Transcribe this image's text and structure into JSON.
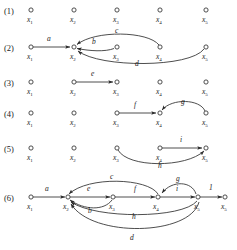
{
  "figure": {
    "background_color": "#ffffff",
    "stroke_color": "#3a3a3a",
    "text_color": "#1c1c1c"
  },
  "row_labels": [
    "(1)",
    "(2)",
    "(3)",
    "(4)",
    "(5)",
    "(6)"
  ],
  "node_names": [
    "x",
    "x",
    "x",
    "x",
    "x"
  ],
  "node_subscripts": [
    "1",
    "2",
    "3",
    "4",
    "5"
  ],
  "rows": [
    {
      "label": "(1)",
      "y": 12,
      "nodes": [
        "x1",
        "x2",
        "x3",
        "x4",
        "x5"
      ],
      "edges": []
    },
    {
      "label": "(2)",
      "y": 47,
      "nodes": [
        "x1",
        "x2",
        "x3",
        "x4",
        "x5"
      ],
      "edges": [
        {
          "name": "a",
          "from": "x1",
          "to": "x2",
          "shape": "straight"
        },
        {
          "name": "b",
          "from": "x3",
          "to": "x2",
          "shape": "arc-slight"
        },
        {
          "name": "c",
          "from": "x4",
          "to": "x2",
          "shape": "arc-above"
        },
        {
          "name": "d",
          "from": "x5",
          "to": "x2",
          "shape": "arc-below"
        }
      ]
    },
    {
      "label": "(3)",
      "y": 82,
      "nodes": [
        "x1",
        "x2",
        "x3",
        "x4",
        "x5"
      ],
      "edges": [
        {
          "name": "e",
          "from": "x2",
          "to": "x3",
          "shape": "straight"
        }
      ]
    },
    {
      "label": "(4)",
      "y": 113,
      "nodes": [
        "x1",
        "x2",
        "x3",
        "x4",
        "x5"
      ],
      "edges": [
        {
          "name": "f",
          "from": "x3",
          "to": "x4",
          "shape": "straight"
        },
        {
          "name": "g",
          "from": "x5",
          "to": "x4",
          "shape": "arc-above"
        }
      ]
    },
    {
      "label": "(5)",
      "y": 148,
      "nodes": [
        "x1",
        "x2",
        "x3",
        "x4",
        "x5"
      ],
      "edges": [
        {
          "name": "i",
          "from": "x4",
          "to": "x5",
          "shape": "straight"
        },
        {
          "name": "h",
          "from": "x3",
          "to": "x5",
          "shape": "arc-below"
        }
      ]
    },
    {
      "label": "(6)",
      "y": 197,
      "nodes": [
        "x1",
        "x2",
        "x3",
        "x4",
        "x5",
        "x5"
      ],
      "edges": [
        {
          "name": "a",
          "from": "x1",
          "to": "x2",
          "shape": "straight"
        },
        {
          "name": "e",
          "from": "x2",
          "to": "x3",
          "shape": "straight"
        },
        {
          "name": "f",
          "from": "x3",
          "to": "x4",
          "shape": "straight"
        },
        {
          "name": "i",
          "from": "x4",
          "to": "x5",
          "shape": "straight"
        },
        {
          "name": "1",
          "from": "x5",
          "to": "x5b",
          "shape": "straight"
        },
        {
          "name": "c",
          "from": "x4",
          "to": "x2",
          "shape": "arc-above"
        },
        {
          "name": "g",
          "from": "x5",
          "to": "x4",
          "shape": "arc-above"
        },
        {
          "name": "b",
          "from": "x3",
          "to": "x2",
          "shape": "arc-below"
        },
        {
          "name": "h",
          "from": "x5",
          "to": "x2",
          "shape": "arc-below"
        },
        {
          "name": "d",
          "from": "x5",
          "to": "x2",
          "shape": "arc-below-deep"
        }
      ]
    }
  ],
  "edge_label_text": {
    "a": "a",
    "b": "b",
    "c": "c",
    "d": "d",
    "e": "e",
    "f": "f",
    "g": "g",
    "h": "h",
    "i": "i",
    "one": "1"
  }
}
